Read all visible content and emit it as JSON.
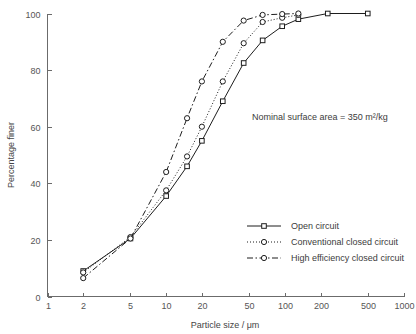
{
  "chart_data": {
    "type": "line",
    "title": "",
    "xlabel": "Particle size / μm",
    "ylabel": "Percentage finer",
    "xscale": "log",
    "xlim": [
      1,
      1000
    ],
    "ylim": [
      0,
      100
    ],
    "grid": false,
    "xticks": [
      1,
      2,
      5,
      10,
      20,
      50,
      100,
      200,
      500,
      1000
    ],
    "xtick_labels": [
      "1",
      "2",
      "5",
      "10",
      "20",
      "50",
      "100",
      "200",
      "500",
      "1000"
    ],
    "yticks": [
      0,
      20,
      40,
      60,
      80,
      100
    ],
    "ytick_labels": [
      "0",
      "20",
      "40",
      "60",
      "80",
      "100"
    ],
    "annotations": [
      {
        "text": "Nominal surface area = 350 m²/kg",
        "x": 40,
        "y": 68
      }
    ],
    "legend_position": "lower right",
    "series": [
      {
        "name": "Open circuit",
        "marker": "square",
        "linestyle": "solid",
        "color": "#1d1d1d",
        "x": [
          2,
          5,
          10,
          15,
          20,
          30,
          45,
          65,
          95,
          130,
          230,
          500
        ],
        "y": [
          9,
          20.5,
          35.5,
          46,
          55,
          69,
          82.5,
          90.5,
          95.5,
          98,
          100,
          100
        ]
      },
      {
        "name": "Conventional closed circuit",
        "marker": "circle",
        "linestyle": "dotted",
        "color": "#1d1d1d",
        "x": [
          2,
          5,
          10,
          15,
          20,
          30,
          45,
          65,
          95,
          130
        ],
        "y": [
          8.5,
          21,
          37.5,
          49.5,
          60,
          76,
          89.5,
          97,
          98.5,
          99.5
        ]
      },
      {
        "name": "High efficiency closed circuit",
        "marker": "circle",
        "linestyle": "dashdot",
        "color": "#1d1d1d",
        "x": [
          2,
          5,
          10,
          15,
          20,
          30,
          45,
          65,
          95,
          130
        ],
        "y": [
          6.5,
          20.5,
          44,
          63,
          76,
          90,
          97.5,
          99.5,
          99.8,
          100
        ]
      }
    ]
  },
  "axes": {
    "x_title": "Particle size / μm",
    "y_title": "Percentage finer"
  },
  "annotation": {
    "nominal_surface_area": "Nominal surface area = 350 m²/kg"
  },
  "legend": {
    "items": [
      {
        "label": "Open circuit"
      },
      {
        "label": "Conventional closed circuit"
      },
      {
        "label": "High efficiency closed circuit"
      }
    ]
  },
  "colors": {
    "line": "#1d1d1d",
    "axis": "#6b6b6b",
    "text": "#3c3c3c",
    "background": "#ffffff"
  }
}
